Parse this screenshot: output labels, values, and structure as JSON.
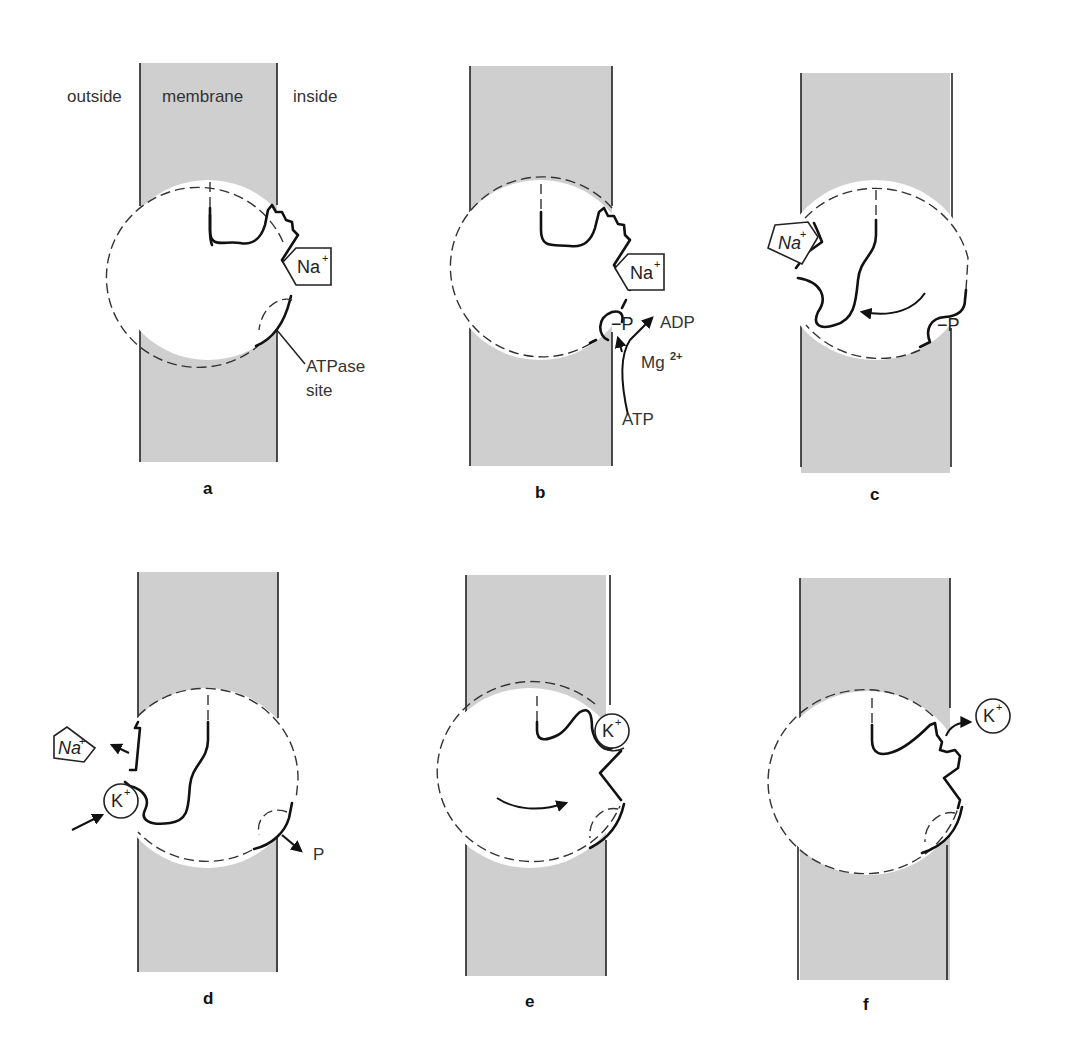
{
  "figure": {
    "region_labels": {
      "outside": "outside",
      "membrane": "membrane",
      "inside": "inside"
    },
    "colors": {
      "membrane_fill": "#cfcfcf",
      "line": "#111111",
      "background": "#ffffff"
    }
  },
  "panels": [
    {
      "letter": "a",
      "ions": [
        {
          "label": "Na",
          "charge": "+",
          "shape": "pentagon"
        }
      ],
      "annotations": [
        "ATPase",
        "site"
      ]
    },
    {
      "letter": "b",
      "ions": [
        {
          "label": "Na",
          "charge": "+",
          "shape": "pentagon"
        }
      ],
      "annotations": [
        "−P",
        "ADP",
        "Mg",
        "2+",
        "ATP"
      ]
    },
    {
      "letter": "c",
      "ions": [
        {
          "label": "Na",
          "charge": "+",
          "shape": "pentagon"
        }
      ],
      "annotations": [
        "−P"
      ]
    },
    {
      "letter": "d",
      "ions": [
        {
          "label": "Na",
          "charge": "+",
          "shape": "pentagon"
        },
        {
          "label": "K",
          "charge": "+",
          "shape": "circle"
        }
      ],
      "annotations": [
        "P"
      ]
    },
    {
      "letter": "e",
      "ions": [
        {
          "label": "K",
          "charge": "+",
          "shape": "circle"
        }
      ],
      "annotations": []
    },
    {
      "letter": "f",
      "ions": [
        {
          "label": "K",
          "charge": "+",
          "shape": "circle"
        }
      ],
      "annotations": []
    }
  ]
}
